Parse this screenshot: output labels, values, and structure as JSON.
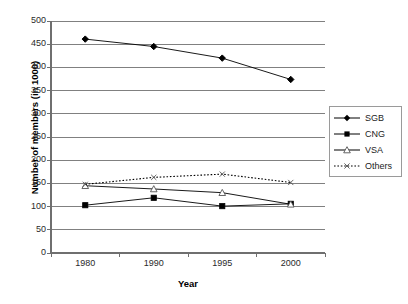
{
  "chart_data": {
    "type": "line",
    "title": "",
    "xlabel": "Year",
    "ylabel": "Number of members (in 1000)",
    "categories": [
      "1980",
      "1990",
      "1995",
      "2000"
    ],
    "ylim": [
      0,
      500
    ],
    "yticks": [
      0,
      50,
      100,
      150,
      200,
      250,
      300,
      350,
      400,
      450,
      500
    ],
    "ytick_labels": [
      "0",
      "50",
      "100",
      "150",
      "200",
      "250",
      "300",
      "350",
      "400",
      "450",
      "500"
    ],
    "grid": "horizontal",
    "legend_position": "right",
    "series": [
      {
        "name": "SGB",
        "marker": "filled-diamond",
        "line": "solid",
        "color": "#000000",
        "values": [
          461,
          445,
          420,
          374
        ]
      },
      {
        "name": "CNG",
        "marker": "filled-square",
        "line": "solid",
        "color": "#000000",
        "values": [
          103,
          119,
          101,
          106
        ]
      },
      {
        "name": "VSA",
        "marker": "open-triangle",
        "line": "solid",
        "color": "#000000",
        "values": [
          145,
          138,
          130,
          105
        ]
      },
      {
        "name": "Others",
        "marker": "x-cross",
        "line": "dotted",
        "color": "#000000",
        "values": [
          148,
          163,
          170,
          152
        ]
      }
    ]
  },
  "legend": {
    "items": [
      {
        "label": "SGB",
        "marker": "filled-diamond",
        "line": "solid"
      },
      {
        "label": "CNG",
        "marker": "filled-square",
        "line": "solid"
      },
      {
        "label": "VSA",
        "marker": "open-triangle",
        "line": "solid"
      },
      {
        "label": "Others",
        "marker": "x-cross",
        "line": "dotted"
      }
    ]
  },
  "colors": {
    "axis": "#6f6f6f",
    "grid": "#808080",
    "series": "#000000",
    "text": "#1c1c1c",
    "background": "#ffffff"
  }
}
